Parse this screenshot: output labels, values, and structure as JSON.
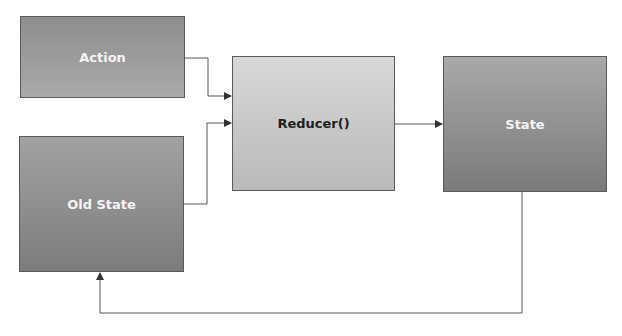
{
  "diagram": {
    "nodes": [
      {
        "id": "action",
        "label": "Action"
      },
      {
        "id": "old_state",
        "label": "Old State"
      },
      {
        "id": "reducer",
        "label": "Reducer()"
      },
      {
        "id": "state",
        "label": "State"
      }
    ],
    "edges": [
      {
        "from": "action",
        "to": "reducer"
      },
      {
        "from": "old_state",
        "to": "reducer"
      },
      {
        "from": "reducer",
        "to": "state"
      },
      {
        "from": "state",
        "to": "old_state",
        "label": "feedback loop"
      }
    ],
    "colors": {
      "line": "#555555",
      "dark_text": "#1e1e1e",
      "light_text": "#f4f4f4"
    }
  }
}
